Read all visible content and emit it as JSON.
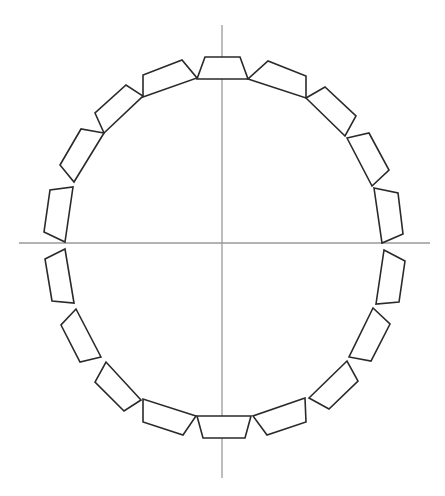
{
  "diagram": {
    "type": "segmented-ring",
    "colors": {
      "background": "#ffffff",
      "axis": "#9a9a9a",
      "segment_stroke": "#2a2a2a"
    },
    "axes": {
      "horizontal": {
        "x1": 19,
        "y1": 243,
        "x2": 430,
        "y2": 243
      },
      "vertical": {
        "x1": 222,
        "y1": 25,
        "x2": 222,
        "y2": 478
      }
    },
    "segment_count": 20,
    "segments": [
      {
        "id": "top",
        "points": "197,79 248,79 240,57 205,57"
      },
      {
        "id": "top-right-1",
        "points": "248,79 306,98 306,76 268,61"
      },
      {
        "id": "top-right-2",
        "points": "306,98 345,136 356,116 325,87"
      },
      {
        "id": "top-right-3",
        "points": "347,138 372,186 389,170 369,133"
      },
      {
        "id": "right-upper",
        "points": "374,188 382,243 403,234 398,193"
      },
      {
        "id": "right-lower",
        "points": "384,250 376,304 399,302 405,261"
      },
      {
        "id": "bottom-right-3",
        "points": "373,308 349,357 371,361 390,324"
      },
      {
        "id": "bottom-right-2",
        "points": "347,361 309,398 329,409 358,381"
      },
      {
        "id": "bottom-right-1",
        "points": "305,398 253,416 267,435 306,422"
      },
      {
        "id": "bottom",
        "points": "251,416 197,416 203,438 245,438"
      },
      {
        "id": "bottom-left-1",
        "points": "196,416 143,399 143,422 183,435"
      },
      {
        "id": "bottom-left-2",
        "points": "141,400 106,362 95,382 124,411"
      },
      {
        "id": "bottom-left-3",
        "points": "101,357 76,309 61,325 80,362"
      },
      {
        "id": "left-lower",
        "points": "74,303 65,249 45,259 52,301"
      },
      {
        "id": "left-upper",
        "points": "65,242 73,187 50,190 44,232"
      },
      {
        "id": "top-left-3",
        "points": "74,182 104,133 81,129 60,165"
      },
      {
        "id": "top-left-2",
        "points": "104,133 143,96 126,85 95,113"
      },
      {
        "id": "top-left-1",
        "points": "143,97 197,78 182,60 143,75"
      }
    ]
  }
}
